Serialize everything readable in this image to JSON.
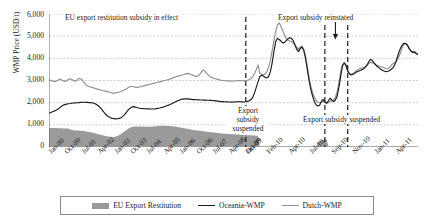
{
  "chart_data": {
    "type": "line",
    "title": "",
    "xlabel": "",
    "ylabel": "WMP Price (USD/t)",
    "ylim": [
      0,
      6000
    ],
    "yticks": [
      "0",
      "1,000",
      "2,000",
      "3,000",
      "4,000",
      "5,000",
      "6,000"
    ],
    "grid": true,
    "legend_position": "bottom",
    "xtick_labels": [
      "Jan-00",
      "Oct-00",
      "Jul-01",
      "Apr-02",
      "Jan-03",
      "Oct-03",
      "Jul-04",
      "Apr-05",
      "Jan-06",
      "Oct-06",
      "Jul-07",
      "Apr-08",
      "Jan-09",
      "Oct-09",
      "Feb-10",
      "Apr-10",
      "Jul-10",
      "Sep-10",
      "Nov-10",
      "Jan-11",
      "Apr-11"
    ],
    "annotations": [
      {
        "name": "eu-subsidy-in-effect",
        "text": "EU export restitution subsidy in effect"
      },
      {
        "name": "export-subsidy-reinstated",
        "text": "Export subsidy reinstated"
      },
      {
        "name": "export-subsidy-suspended-left",
        "line1": "Export",
        "line2": "subsidy",
        "line3": "suspended"
      },
      {
        "name": "export-subsidy-suspended-right",
        "text": "Export subsidy suspended"
      }
    ],
    "series": [
      {
        "name": "EU Export Restitution",
        "type": "area",
        "color": "#9a9a9a",
        "values": [
          860,
          860,
          860,
          860,
          855,
          850,
          850,
          845,
          840,
          840,
          835,
          830,
          790,
          775,
          760,
          750,
          745,
          740,
          735,
          730,
          720,
          700,
          690,
          680,
          650,
          640,
          620,
          600,
          580,
          560,
          545,
          520,
          500,
          480,
          470,
          460,
          450,
          455,
          470,
          500,
          540,
          590,
          650,
          700,
          760,
          820,
          870,
          900,
          915,
          925,
          930,
          930,
          928,
          925,
          920,
          918,
          915,
          915,
          918,
          922,
          930,
          940,
          950,
          955,
          960,
          962,
          960,
          955,
          950,
          945,
          940,
          930,
          920,
          905,
          890,
          875,
          860,
          845,
          830,
          815,
          800,
          785,
          770,
          760,
          750,
          740,
          730,
          720,
          710,
          700,
          690,
          680,
          670,
          660,
          650,
          640,
          630,
          620,
          612,
          605,
          600,
          595,
          590,
          585,
          580,
          575,
          570,
          565,
          560,
          555,
          550,
          545,
          540,
          535,
          530,
          525,
          520,
          515,
          512,
          510,
          0,
          0,
          0,
          0,
          0,
          0,
          0,
          0,
          0,
          0,
          0,
          0,
          0,
          0,
          0,
          0,
          0,
          0,
          0,
          0,
          0,
          0,
          0,
          0,
          0,
          0,
          0,
          0,
          0,
          0,
          0,
          0,
          0,
          230,
          260,
          300,
          330,
          340,
          345,
          0,
          0,
          0,
          0,
          0,
          0,
          0,
          0,
          0,
          0,
          0,
          0,
          0,
          0,
          0,
          0,
          0,
          0,
          0,
          0,
          0,
          0,
          0,
          0,
          0,
          0,
          0,
          0,
          0,
          0,
          0,
          0,
          0,
          0,
          0,
          0,
          0,
          0,
          0,
          0,
          0,
          0
        ]
      },
      {
        "name": "Oceania-WMP",
        "type": "line",
        "color": "#1a1a1a",
        "values": [
          1520,
          1560,
          1590,
          1620,
          1660,
          1700,
          1760,
          1830,
          1880,
          1910,
          1935,
          1950,
          1960,
          1975,
          1985,
          1990,
          1995,
          2000,
          2010,
          2020,
          2020,
          2015,
          2010,
          2005,
          2000,
          1985,
          1960,
          1920,
          1860,
          1790,
          1700,
          1600,
          1500,
          1420,
          1360,
          1320,
          1290,
          1280,
          1270,
          1275,
          1290,
          1320,
          1380,
          1460,
          1560,
          1660,
          1740,
          1790,
          1820,
          1800,
          1780,
          1760,
          1745,
          1735,
          1730,
          1725,
          1720,
          1718,
          1715,
          1715,
          1720,
          1730,
          1745,
          1760,
          1780,
          1800,
          1830,
          1860,
          1890,
          1920,
          1960,
          2000,
          2040,
          2080,
          2110,
          2140,
          2160,
          2170,
          2175,
          2170,
          2160,
          2150,
          2140,
          2135,
          2130,
          2125,
          2120,
          2118,
          2115,
          2112,
          2110,
          2108,
          2105,
          2100,
          2090,
          2080,
          2070,
          2060,
          2050,
          2045,
          2040,
          2035,
          2030,
          2028,
          2025,
          2030,
          2035,
          2040,
          2045,
          2040,
          2035,
          2030,
          2040,
          2060,
          2090,
          2140,
          2250,
          2450,
          2700,
          2950,
          3180,
          3240,
          3200,
          3150,
          3120,
          3180,
          3400,
          3800,
          4300,
          4750,
          4900,
          4850,
          4780,
          4700,
          4720,
          4800,
          4880,
          4930,
          4900,
          4800,
          4600,
          4400,
          4300,
          4450,
          4500,
          4350,
          4000,
          3500,
          3000,
          2600,
          2300,
          2050,
          1900,
          1850,
          1880,
          2050,
          2150,
          2050,
          1980,
          2080,
          2200,
          2120,
          2050,
          2120,
          2300,
          2700,
          3200,
          3650,
          3800,
          3700,
          3450,
          3300,
          3250,
          3280,
          3320,
          3380,
          3420,
          3450,
          3480,
          3520,
          3600,
          3700,
          3850,
          3950,
          3900,
          3800,
          3700,
          3620,
          3560,
          3500,
          3450,
          3420,
          3400,
          3420,
          3460,
          3520,
          3600,
          3750,
          3980,
          4250,
          4450,
          4600,
          4680,
          4670,
          4600,
          4450,
          4320,
          4260,
          4280,
          4200,
          4180
        ]
      },
      {
        "name": "Dutch-WMP",
        "type": "line",
        "color": "#8f8f8f",
        "values": [
          3030,
          3010,
          2980,
          2950,
          2970,
          3010,
          3060,
          3030,
          2990,
          2960,
          2990,
          3050,
          3080,
          3050,
          3000,
          2960,
          3020,
          3100,
          3080,
          3010,
          2900,
          2800,
          2750,
          2720,
          2700,
          2680,
          2650,
          2620,
          2600,
          2580,
          2560,
          2540,
          2520,
          2500,
          2480,
          2460,
          2440,
          2430,
          2440,
          2460,
          2480,
          2500,
          2540,
          2580,
          2620,
          2680,
          2720,
          2740,
          2720,
          2700,
          2690,
          2700,
          2720,
          2740,
          2760,
          2780,
          2800,
          2820,
          2840,
          2860,
          2880,
          2900,
          2920,
          2940,
          2960,
          2980,
          3000,
          3020,
          3040,
          3070,
          3100,
          3130,
          3160,
          3190,
          3210,
          3230,
          3250,
          3280,
          3300,
          3320,
          3300,
          3260,
          3230,
          3200,
          3180,
          3220,
          3300,
          3420,
          3480,
          3400,
          3300,
          3220,
          3160,
          3120,
          3090,
          3070,
          3050,
          3030,
          3010,
          3000,
          2990,
          2985,
          2980,
          2975,
          2970,
          2975,
          2980,
          2990,
          3000,
          2995,
          2990,
          2985,
          2995,
          3010,
          3040,
          3090,
          3180,
          3320,
          3500,
          3700,
          3320,
          3280,
          3260,
          3300,
          3400,
          3600,
          3900,
          4350,
          4800,
          5200,
          5500,
          5600,
          5450,
          5250,
          5050,
          4900,
          4820,
          4780,
          4760,
          4700,
          4600,
          4500,
          4420,
          4500,
          4560,
          4400,
          4100,
          3650,
          3150,
          2750,
          2450,
          2250,
          2100,
          2030,
          2000,
          2020,
          2050,
          2000,
          1980,
          2000,
          2050,
          2080,
          2120,
          2250,
          2500,
          2900,
          3400,
          3700,
          3780,
          3650,
          3400,
          3300,
          3280,
          3320,
          3380,
          3450,
          3500,
          3540,
          3560,
          3580,
          3620,
          3680,
          3760,
          3820,
          3800,
          3760,
          3700,
          3660,
          3640,
          3620,
          3600,
          3560,
          3520,
          3540,
          3600,
          3700,
          3780,
          3820,
          3900,
          4050,
          4250,
          4480,
          4640,
          4660,
          4560,
          4420,
          4340,
          4300,
          4320,
          4250,
          4230
        ]
      }
    ]
  },
  "legend": {
    "items": [
      {
        "label": "EU Export Restitution",
        "swatch": "area-swatch"
      },
      {
        "label": "Oceania-WMP",
        "swatch": "dark-line-swatch"
      },
      {
        "label": "Dutch-WMP",
        "swatch": "gray-line-swatch"
      }
    ]
  }
}
